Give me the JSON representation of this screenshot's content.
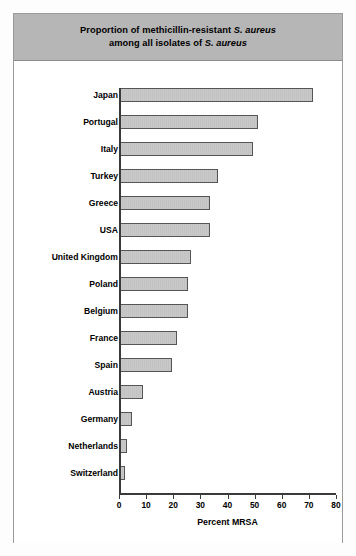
{
  "figure": {
    "title_line1_pre": "Proportion of methicillin-resistant ",
    "title_line1_italic": "S. aureus",
    "title_line2_pre": "among all isolates of ",
    "title_line2_italic": "S. aureus",
    "title_plain": "Proportion of methicillin-resistant S. aureus among all isolates of S. aureus"
  },
  "colors": {
    "title_band": "#b6b6b6",
    "bar_fill": "#c6c6c6",
    "bar_border": "#555555",
    "axis": "#3a3a3a",
    "frame": "#9a9a9a",
    "page_background": "#fdfdfd"
  },
  "chart_data": {
    "type": "bar",
    "orientation": "horizontal",
    "title": "Proportion of methicillin-resistant S. aureus among all isolates of S. aureus",
    "xlabel": "Percent MRSA",
    "ylabel": "",
    "xlim": [
      0,
      80
    ],
    "xticks": [
      0,
      10,
      20,
      30,
      40,
      50,
      60,
      70,
      80
    ],
    "xtick_labels": [
      "0",
      "10",
      "20",
      "30",
      "40",
      "50",
      "60",
      "70",
      "80"
    ],
    "grid": false,
    "legend": false,
    "categories": [
      "Japan",
      "Portugal",
      "Italy",
      "Turkey",
      "Greece",
      "USA",
      "United Kingdom",
      "Poland",
      "Belgium",
      "France",
      "Spain",
      "Austria",
      "Germany",
      "Netherlands",
      "Switzerland"
    ],
    "values": [
      71,
      51,
      49,
      36,
      33,
      33,
      26,
      25,
      25,
      21,
      19,
      8.5,
      4.5,
      2.5,
      2
    ],
    "value_unit": "percent"
  }
}
